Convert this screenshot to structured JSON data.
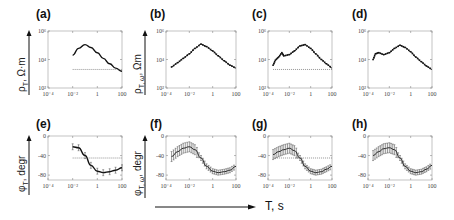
{
  "figure": {
    "x_axis_title": "T, s",
    "panels_top": [
      {
        "id": "a",
        "label": "(a)",
        "ylabel_main": "ρ",
        "ylabel_sub": "T",
        "ylabel_unit": ", Ω·m"
      },
      {
        "id": "b",
        "label": "(b)",
        "ylabel_main": "ρ",
        "ylabel_sub": "T, ω",
        "ylabel_unit": ", Ωm"
      },
      {
        "id": "c",
        "label": "(c)"
      },
      {
        "id": "d",
        "label": "(d)"
      }
    ],
    "panels_bottom": [
      {
        "id": "e",
        "label": "(e)",
        "ylabel_main": "φ",
        "ylabel_sub": "T",
        "ylabel_unit": ", degr"
      },
      {
        "id": "f",
        "label": "(f)",
        "ylabel_main": "φ",
        "ylabel_sub": "T, ω",
        "ylabel_unit": ", degr"
      },
      {
        "id": "g",
        "label": "(g)"
      },
      {
        "id": "h",
        "label": "(h)"
      }
    ],
    "x_ticks": [
      "10^-4",
      "10^-2",
      "1",
      "100"
    ],
    "y_ticks_resistivity": [
      "10^2",
      "10^4",
      "10^6"
    ],
    "y_ticks_phase": [
      "0",
      "-40",
      "-80"
    ]
  },
  "chart_data": [
    {
      "panel": "a",
      "type": "line",
      "title": "(a)",
      "xlabel": "T, s",
      "ylabel": "ρT, Ω·m",
      "xscale": "log",
      "yscale": "log",
      "xlim": [
        0.0001,
        100
      ],
      "ylim": [
        100,
        1000000
      ],
      "series": [
        {
          "name": "apparent resistivity",
          "x": [
            0.01,
            0.03,
            0.1,
            0.3,
            1,
            3,
            10,
            30,
            100
          ],
          "y": [
            20000,
            60000,
            110000,
            70000,
            30000,
            12000,
            5000,
            2500,
            1500
          ]
        },
        {
          "name": "reference (dotted)",
          "x": [
            0.01,
            100
          ],
          "y": [
            2000,
            2000
          ]
        }
      ]
    },
    {
      "panel": "b",
      "type": "scatter",
      "title": "(b)",
      "xlabel": "T, s",
      "ylabel": "ρT,ω, Ωm",
      "xscale": "log",
      "yscale": "log",
      "xlim": [
        0.0001,
        100
      ],
      "ylim": [
        100,
        1000000
      ],
      "series": [
        {
          "name": "resistivity",
          "x": [
            0.0003,
            0.001,
            0.003,
            0.01,
            0.03,
            0.1,
            0.3,
            1,
            3,
            10,
            30,
            100
          ],
          "y": [
            3000,
            6000,
            12000,
            25000,
            60000,
            120000,
            80000,
            40000,
            18000,
            8000,
            4000,
            2500
          ]
        }
      ]
    },
    {
      "panel": "c",
      "type": "scatter",
      "title": "(c)",
      "xlabel": "T, s",
      "xscale": "log",
      "yscale": "log",
      "xlim": [
        0.0001,
        100
      ],
      "ylim": [
        100,
        1000000
      ],
      "series": [
        {
          "name": "resistivity",
          "x": [
            0.0003,
            0.0005,
            0.001,
            0.002,
            0.003,
            0.01,
            0.03,
            0.1,
            0.3,
            1,
            3,
            10,
            30,
            100
          ],
          "y": [
            4000,
            9000,
            15000,
            30000,
            18000,
            22000,
            40000,
            90000,
            110000,
            60000,
            25000,
            10000,
            5000,
            2500
          ]
        },
        {
          "name": "reference (dotted)",
          "x": [
            0.0003,
            100
          ],
          "y": [
            2000,
            2000
          ]
        }
      ]
    },
    {
      "panel": "d",
      "type": "scatter",
      "title": "(d)",
      "xlabel": "T, s",
      "xscale": "log",
      "yscale": "log",
      "xlim": [
        0.0001,
        100
      ],
      "ylim": [
        100,
        1000000
      ],
      "series": [
        {
          "name": "resistivity",
          "x": [
            0.0003,
            0.0005,
            0.001,
            0.003,
            0.01,
            0.03,
            0.1,
            0.3,
            1,
            3,
            10,
            30,
            100
          ],
          "y": [
            10000,
            25000,
            30000,
            22000,
            30000,
            60000,
            100000,
            70000,
            35000,
            15000,
            7000,
            3500,
            2000
          ]
        }
      ]
    },
    {
      "panel": "e",
      "type": "line",
      "title": "(e)",
      "xlabel": "T, s",
      "ylabel": "φT, degr",
      "xscale": "log",
      "xlim": [
        0.0001,
        100
      ],
      "ylim": [
        -90,
        0
      ],
      "series": [
        {
          "name": "phase",
          "x": [
            0.01,
            0.03,
            0.1,
            0.3,
            1,
            3,
            10,
            30,
            100
          ],
          "y": [
            -22,
            -24,
            -40,
            -60,
            -72,
            -75,
            -73,
            -70,
            -65
          ]
        },
        {
          "name": "reference (dotted)",
          "x": [
            0.01,
            100
          ],
          "y": [
            -45,
            -45
          ]
        }
      ]
    },
    {
      "panel": "f",
      "type": "scatter",
      "title": "(f)",
      "xlabel": "T, s",
      "ylabel": "φT,ω, degr",
      "xscale": "log",
      "xlim": [
        0.0001,
        100
      ],
      "ylim": [
        -90,
        0
      ],
      "series": [
        {
          "name": "phase",
          "x": [
            0.0003,
            0.001,
            0.003,
            0.01,
            0.03,
            0.1,
            0.3,
            1,
            3,
            10,
            30,
            100
          ],
          "y": [
            -42,
            -32,
            -25,
            -22,
            -28,
            -45,
            -62,
            -72,
            -75,
            -73,
            -70,
            -62
          ]
        }
      ]
    },
    {
      "panel": "g",
      "type": "scatter",
      "title": "(g)",
      "xlabel": "T, s",
      "xscale": "log",
      "xlim": [
        0.0001,
        100
      ],
      "ylim": [
        -90,
        0
      ],
      "series": [
        {
          "name": "phase",
          "x": [
            0.0003,
            0.001,
            0.003,
            0.01,
            0.03,
            0.1,
            0.3,
            1,
            3,
            10,
            30,
            100
          ],
          "y": [
            -38,
            -32,
            -28,
            -25,
            -30,
            -45,
            -62,
            -72,
            -75,
            -73,
            -68,
            -62
          ]
        },
        {
          "name": "reference (dotted)",
          "x": [
            0.0003,
            100
          ],
          "y": [
            -45,
            -45
          ]
        }
      ]
    },
    {
      "panel": "h",
      "type": "scatter",
      "title": "(h)",
      "xlabel": "T, s",
      "xscale": "log",
      "xlim": [
        0.0001,
        100
      ],
      "ylim": [
        -90,
        0
      ],
      "series": [
        {
          "name": "phase",
          "x": [
            0.0003,
            0.001,
            0.003,
            0.01,
            0.03,
            0.1,
            0.3,
            1,
            3,
            10,
            30,
            100
          ],
          "y": [
            -40,
            -32,
            -26,
            -24,
            -28,
            -45,
            -62,
            -72,
            -75,
            -73,
            -68,
            -60
          ]
        }
      ]
    }
  ]
}
